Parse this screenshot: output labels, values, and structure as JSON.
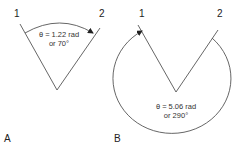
{
  "diagram": {
    "panel_a": {
      "label": "A",
      "ray_labels": [
        "1",
        "2"
      ],
      "angle_line1": "θ = 1.22 rad",
      "angle_line2": "or 70°"
    },
    "panel_b": {
      "label": "B",
      "ray_labels": [
        "1",
        "2"
      ],
      "angle_line1": "θ = 5.06 rad",
      "angle_line2": "or 290°"
    },
    "colors": {
      "line": "#555555",
      "text": "#222222"
    }
  }
}
